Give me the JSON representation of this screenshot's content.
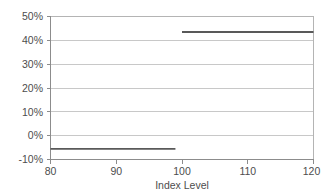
{
  "chart_data": {
    "type": "line",
    "title": "",
    "subtitle": "",
    "xlabel": "Index Level",
    "ylabel": "",
    "xlim": [
      80,
      120
    ],
    "ylim": [
      -0.1,
      0.5
    ],
    "grid": true,
    "legend": null,
    "x_ticks": [
      80,
      90,
      100,
      110,
      120
    ],
    "x_tick_labels": [
      "80",
      "90",
      "100",
      "110",
      "120"
    ],
    "y_ticks": [
      -0.1,
      0.0,
      0.1,
      0.2,
      0.3,
      0.4,
      0.5
    ],
    "y_tick_labels": [
      "-10%",
      "0%",
      "10%",
      "20%",
      "30%",
      "40%",
      "50%"
    ],
    "series": [
      {
        "name": "Payoff",
        "color": "#595959",
        "segments": [
          {
            "x": [
              80,
              99
            ],
            "y": [
              -0.055,
              -0.055
            ]
          },
          {
            "x": [
              100,
              120
            ],
            "y": [
              0.435,
              0.435
            ]
          }
        ]
      }
    ],
    "annotations": []
  },
  "axis": {
    "y_labels": [
      "50%",
      "40%",
      "30%",
      "20%",
      "10%",
      "0%",
      "-10%"
    ],
    "x_labels": [
      "80",
      "90",
      "100",
      "110",
      "120"
    ],
    "x_title": "Index Level"
  },
  "colors": {
    "line": "#595959",
    "grid": "#c8c8c8",
    "axis": "#8c8c8c",
    "text": "#4d4d4d",
    "background": "#ffffff"
  }
}
